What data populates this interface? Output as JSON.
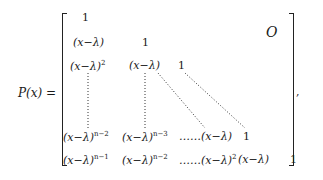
{
  "equation": {
    "lhs": "P(x) =",
    "zero_block": "O",
    "trailing_punct": ",",
    "rows": [
      [
        {
          "base": "1",
          "exp": ""
        }
      ],
      [
        {
          "base": "(x−λ)",
          "exp": ""
        },
        {
          "base": "1",
          "exp": ""
        }
      ],
      [
        {
          "base": "(x−λ)",
          "exp": "2"
        },
        {
          "base": "(x−λ)",
          "exp": ""
        },
        {
          "base": "1",
          "exp": ""
        }
      ],
      [
        {
          "base": "(x−λ)",
          "exp": "n−2"
        },
        {
          "base": "(x−λ)",
          "exp": "n−3"
        },
        {
          "base": "……(x−λ)",
          "exp": ""
        },
        {
          "base": "1",
          "exp": ""
        }
      ],
      [
        {
          "base": "(x−λ)",
          "exp": "n−1"
        },
        {
          "base": "(x−λ)",
          "exp": "n−2"
        },
        {
          "base": "……(x−λ)",
          "exp": "2"
        },
        {
          "base": "(x−λ)",
          "exp": ""
        },
        {
          "base": "1",
          "exp": ""
        }
      ]
    ]
  }
}
